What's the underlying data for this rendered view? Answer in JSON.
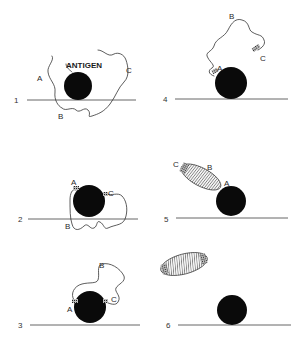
{
  "figure": {
    "colors": {
      "background": "#ffffff",
      "antigen": "#0a0a0a",
      "line": "#555555",
      "chain": "#333333"
    },
    "antigen_label": "ANTIGEN",
    "panels": [
      {
        "step": "1",
        "site_labels": {
          "a": "A",
          "b": "B",
          "c": "C"
        }
      },
      {
        "step": "2",
        "site_labels": {
          "a": "A",
          "b": "B",
          "c": "C"
        }
      },
      {
        "step": "3",
        "site_labels": {
          "a": "A",
          "b": "B",
          "c": "C"
        }
      },
      {
        "step": "4",
        "site_labels": {
          "a": "A",
          "b": "B",
          "c": "C"
        }
      },
      {
        "step": "5",
        "site_labels": {
          "a": "A",
          "b": "B",
          "c": "C"
        }
      },
      {
        "step": "6"
      }
    ]
  }
}
